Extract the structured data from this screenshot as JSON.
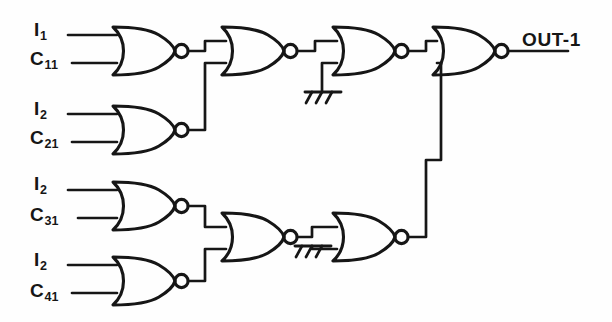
{
  "diagram": {
    "stroke_color": "#161616",
    "background_color": "#fefefe",
    "output": {
      "label": "OUT-1",
      "name": "output-terminal-out-1"
    },
    "inputs": [
      {
        "id": "in-i1",
        "base": "I",
        "sub": "1",
        "text": "I1",
        "x": 34,
        "y": 20
      },
      {
        "id": "in-c11",
        "base": "C",
        "sub": "11",
        "text": "C11",
        "x": 30,
        "y": 49
      },
      {
        "id": "in-i2a",
        "base": "I",
        "sub": "2",
        "text": "I2",
        "x": 34,
        "y": 99
      },
      {
        "id": "in-c21",
        "base": "C",
        "sub": "21",
        "text": "C21",
        "x": 30,
        "y": 128
      },
      {
        "id": "in-i2b",
        "base": "I",
        "sub": "2",
        "text": "I2",
        "x": 34,
        "y": 174
      },
      {
        "id": "in-c31",
        "base": "C",
        "sub": "31",
        "text": "C31",
        "x": 30,
        "y": 205
      },
      {
        "id": "in-i2c",
        "base": "I",
        "sub": "2",
        "text": "I2",
        "x": 34,
        "y": 250
      },
      {
        "id": "in-c41",
        "base": "C",
        "sub": "41",
        "text": "C41",
        "x": 30,
        "y": 281
      }
    ],
    "gates": [
      {
        "id": "gate-1",
        "type": "NOR",
        "stage": 1,
        "x": 113,
        "y": 27,
        "w": 62,
        "h": 48,
        "inputs": [
          "I1",
          "C11"
        ]
      },
      {
        "id": "gate-2",
        "type": "NOR",
        "stage": 1,
        "x": 113,
        "y": 106,
        "w": 62,
        "h": 48,
        "inputs": [
          "I2",
          "C21"
        ]
      },
      {
        "id": "gate-3",
        "type": "NOR",
        "stage": 1,
        "x": 113,
        "y": 182,
        "w": 62,
        "h": 48,
        "inputs": [
          "I2",
          "C31"
        ]
      },
      {
        "id": "gate-4",
        "type": "NOR",
        "stage": 1,
        "x": 113,
        "y": 257,
        "w": 62,
        "h": 48,
        "inputs": [
          "I2",
          "C41"
        ]
      },
      {
        "id": "gate-5",
        "type": "NOR",
        "stage": 2,
        "x": 222,
        "y": 27,
        "w": 62,
        "h": 48,
        "inputs": [
          "gate-1",
          "gate-2"
        ]
      },
      {
        "id": "gate-6",
        "type": "NOR",
        "stage": 2,
        "x": 222,
        "y": 213,
        "w": 62,
        "h": 48,
        "inputs": [
          "gate-3",
          "gate-4"
        ]
      },
      {
        "id": "gate-7",
        "type": "NOR",
        "stage": 3,
        "x": 333,
        "y": 27,
        "w": 62,
        "h": 48,
        "inputs": [
          "gate-5",
          "GND"
        ]
      },
      {
        "id": "gate-8",
        "type": "NOR",
        "stage": 3,
        "x": 333,
        "y": 213,
        "w": 62,
        "h": 48,
        "inputs": [
          "gate-6",
          "GND"
        ]
      },
      {
        "id": "gate-9",
        "type": "NOR",
        "stage": 4,
        "x": 433,
        "y": 27,
        "w": 62,
        "h": 48,
        "inputs": [
          "gate-7",
          "gate-8"
        ]
      }
    ],
    "grounds": [
      {
        "id": "ground-upper",
        "x": 322,
        "y": 92,
        "name": "ground-symbol-upper"
      },
      {
        "id": "ground-lower",
        "x": 312,
        "y": 246,
        "name": "ground-symbol-lower"
      }
    ],
    "gate_count": 9,
    "input_count": 8
  }
}
